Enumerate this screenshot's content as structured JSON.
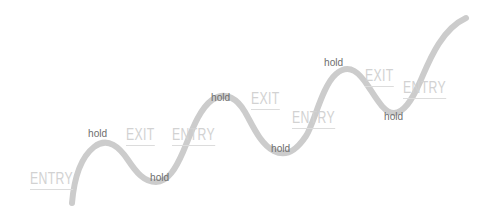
{
  "chart_data": {
    "type": "line",
    "title": "",
    "subtitle": "",
    "xlabel": "",
    "ylabel": "",
    "grid": false,
    "legend": false,
    "line_color": "#cccccc",
    "signal_color": "#d2d2d2",
    "hold_color": "#6e6e6e",
    "background_color": "#ffffff",
    "path": "M72,203 C74,180 80,158 94,147 C108,136 120,148 128,160 C136,172 144,182 156,182 C168,182 176,168 183,152 C190,136 198,110 212,100 C226,90 238,100 245,112 C252,124 260,144 274,151 C288,158 298,148 306,136 C314,124 322,86 336,74 C350,62 360,74 368,86 C376,98 384,113 394,113 C404,113 412,100 420,82 C428,64 440,30 466,18",
    "x_values": [
      72,
      94,
      128,
      156,
      183,
      212,
      245,
      274,
      306,
      336,
      368,
      394,
      420,
      466
    ],
    "y_values": [
      203,
      147,
      160,
      182,
      152,
      100,
      112,
      151,
      136,
      74,
      86,
      113,
      82,
      18
    ],
    "annotations": [
      {
        "text": "ENTRY",
        "kind": "entry",
        "x": 30,
        "y": 170
      },
      {
        "text": "hold",
        "kind": "hold",
        "x": 88,
        "y": 128
      },
      {
        "text": "EXIT",
        "kind": "exit",
        "x": 126,
        "y": 126
      },
      {
        "text": "ENTRY",
        "kind": "entry",
        "x": 172,
        "y": 126
      },
      {
        "text": "hold",
        "kind": "hold",
        "x": 150,
        "y": 172
      },
      {
        "text": "hold",
        "kind": "hold",
        "x": 211,
        "y": 92
      },
      {
        "text": "EXIT",
        "kind": "exit",
        "x": 251,
        "y": 90
      },
      {
        "text": "ENTRY",
        "kind": "entry",
        "x": 292,
        "y": 109
      },
      {
        "text": "hold",
        "kind": "hold",
        "x": 271,
        "y": 143
      },
      {
        "text": "hold",
        "kind": "hold",
        "x": 324,
        "y": 57
      },
      {
        "text": "EXIT",
        "kind": "exit",
        "x": 365,
        "y": 67
      },
      {
        "text": "ENTRY",
        "kind": "entry",
        "x": 403,
        "y": 79
      },
      {
        "text": "hold",
        "kind": "hold",
        "x": 384,
        "y": 111
      }
    ]
  }
}
